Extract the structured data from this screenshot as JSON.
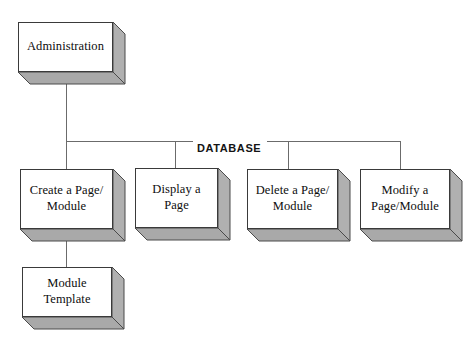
{
  "diagram": {
    "bus_label": "DATABASE",
    "colors": {
      "background": "#ffffff",
      "box_fill": "#ffffff",
      "box_border": "#3a3a3a",
      "extrude_right": "#b0b0b0",
      "extrude_bottom": "#a9a9a9",
      "connector": "#6b6b6b",
      "text": "#0d0d0d"
    },
    "nodes": {
      "administration": {
        "label": "Administration"
      },
      "create_page_module": {
        "label": "Create a Page/ Module"
      },
      "display_page": {
        "label": "Display a Page"
      },
      "delete_page_module": {
        "label": "Delete a Page/ Module"
      },
      "modify_page_module": {
        "label": "Modify a Page/Module"
      },
      "module_template": {
        "label": "Module Template"
      }
    }
  }
}
